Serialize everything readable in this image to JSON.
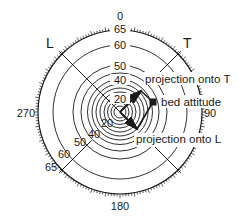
{
  "diagram": {
    "type": "polar-projection",
    "center": [
      120,
      112
    ],
    "outer_radius": 82,
    "azimuth_labels": [
      {
        "text": "0",
        "angle": 0
      },
      {
        "text": "90",
        "angle": 90
      },
      {
        "text": "180",
        "angle": 180
      },
      {
        "text": "270",
        "angle": 270
      }
    ],
    "dip_circles": [
      {
        "dip": 5,
        "r": 6
      },
      {
        "dip": 10,
        "r": 9
      },
      {
        "dip": 15,
        "r": 12.5
      },
      {
        "dip": 20,
        "r": 16
      },
      {
        "dip": 25,
        "r": 20
      },
      {
        "dip": 30,
        "r": 24
      },
      {
        "dip": 35,
        "r": 28
      },
      {
        "dip": 40,
        "r": 32.5
      },
      {
        "dip": 45,
        "r": 39
      },
      {
        "dip": 50,
        "r": 47
      },
      {
        "dip": 60,
        "r": 67
      },
      {
        "dip": 65,
        "r": 82
      }
    ],
    "dip_labels_top": [
      "20",
      "40",
      "50",
      "60",
      "65"
    ],
    "dip_labels_lower_left": [
      "20",
      "40",
      "50",
      "60",
      "65"
    ],
    "axes": [
      {
        "name": "L",
        "azimuth": 315
      },
      {
        "name": "T",
        "azimuth": 45
      }
    ],
    "annotations": {
      "projection_T": "projection onto T",
      "bed_attitude": "bed attitude",
      "projection_L": "projection onto L"
    },
    "colors": {
      "line": "#1a1a1a",
      "background": "#ffffff"
    }
  }
}
